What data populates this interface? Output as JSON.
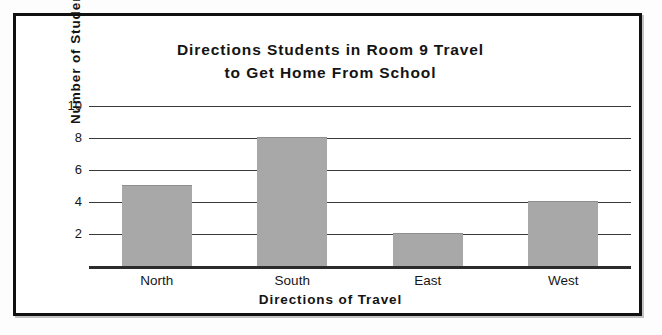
{
  "chart_data": {
    "type": "bar",
    "title": "Directions Students in Room 9 Travel to Get Home From School",
    "title_lines": [
      "Directions Students in Room 9 Travel",
      "to Get Home From School"
    ],
    "categories": [
      "North",
      "South",
      "East",
      "West"
    ],
    "values": [
      5,
      8,
      2,
      4
    ],
    "xlabel": "Directions of Travel",
    "ylabel": "Number of Students",
    "ylim": [
      0,
      10
    ],
    "ytick_labels": [
      "2",
      "4",
      "6",
      "8",
      "10"
    ],
    "ytick_values": [
      2,
      4,
      6,
      8,
      10
    ],
    "grid": "horizontal",
    "legend": "none",
    "bar_color": "#a8a8a8",
    "axis_color": "#2b2b2b",
    "gridline_color": "#3a3a3a",
    "frame_color": "#111111",
    "background_color": "#ffffff"
  }
}
